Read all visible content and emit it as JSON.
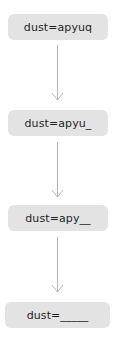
{
  "diagram": {
    "type": "flow-vertical",
    "nodes": [
      {
        "id": "n1",
        "label": "dust=apyuq"
      },
      {
        "id": "n2",
        "label": "dust=apyu_"
      },
      {
        "id": "n3",
        "label": "dust=apy__"
      },
      {
        "id": "n4",
        "label": "dust=_____"
      }
    ],
    "edges": [
      {
        "from": "n1",
        "to": "n2"
      },
      {
        "from": "n2",
        "to": "n3"
      },
      {
        "from": "n3",
        "to": "n4"
      }
    ],
    "colors": {
      "node_fill": "#e3e3e3",
      "node_text": "#1e1e1e",
      "arrow": "#b4b4b4"
    }
  }
}
